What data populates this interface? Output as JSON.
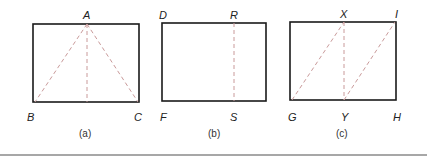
{
  "colors": {
    "outline": "#1a1a1a",
    "dashed": "#c99a9a",
    "text": "#222222",
    "rule": "#8a8a8a"
  },
  "panels": [
    {
      "caption": "(a)",
      "rect": {
        "x": 33,
        "y": 24,
        "w": 106,
        "h": 78
      },
      "labels": [
        {
          "text": "A",
          "x": 87,
          "y": 16
        },
        {
          "text": "B",
          "x": 30,
          "y": 117
        },
        {
          "text": "C",
          "x": 137,
          "y": 117
        }
      ],
      "dashed_lines": [
        {
          "from": "A",
          "to": "B"
        },
        {
          "from": "A",
          "to": "C"
        },
        {
          "from": "A",
          "to": "midpoint of BC"
        }
      ]
    },
    {
      "caption": "(b)",
      "rect": {
        "x": 162,
        "y": 23,
        "w": 104,
        "h": 78
      },
      "labels": [
        {
          "text": "D",
          "x": 160,
          "y": 16
        },
        {
          "text": "R",
          "x": 233,
          "y": 16
        },
        {
          "text": "F",
          "x": 161,
          "y": 117
        },
        {
          "text": "S",
          "x": 233,
          "y": 117
        }
      ],
      "dashed_lines": [
        {
          "from": "R",
          "to": "S"
        }
      ]
    },
    {
      "caption": "(c)",
      "rect": {
        "x": 290,
        "y": 22,
        "w": 106,
        "h": 78
      },
      "labels": [
        {
          "text": "X",
          "x": 344,
          "y": 15
        },
        {
          "text": "I",
          "x": 396,
          "y": 15
        },
        {
          "text": "G",
          "x": 289,
          "y": 117
        },
        {
          "text": "Y",
          "x": 344,
          "y": 117
        },
        {
          "text": "H",
          "x": 396,
          "y": 117
        }
      ],
      "dashed_lines": [
        {
          "from": "G",
          "to": "X"
        },
        {
          "from": "X",
          "to": "Y"
        },
        {
          "from": "Y",
          "to": "I"
        }
      ]
    }
  ]
}
